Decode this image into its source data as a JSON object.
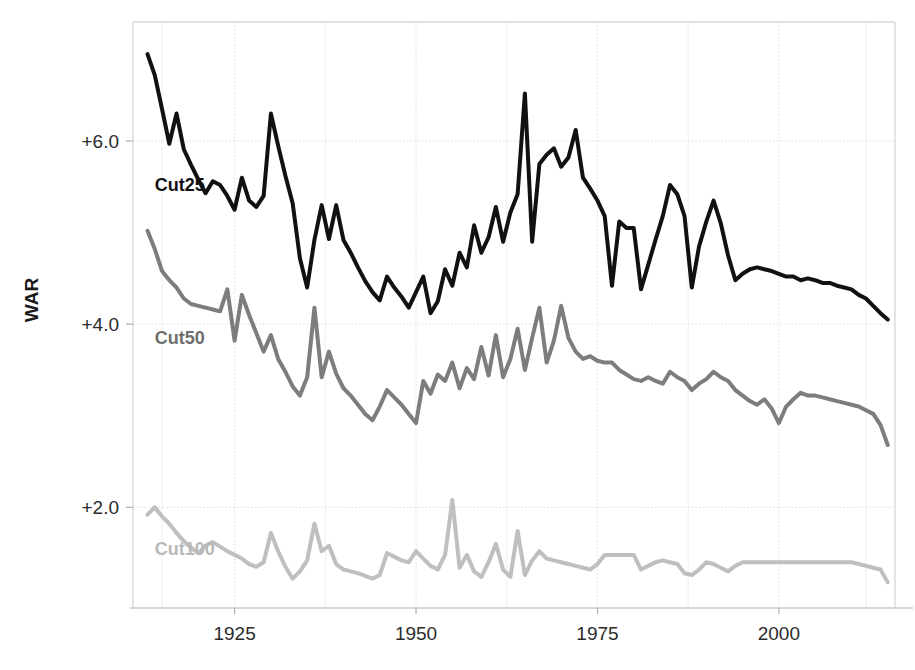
{
  "chart_data": {
    "type": "line",
    "title": "",
    "subtitle": "",
    "xlabel": "",
    "ylabel": "WAR",
    "xlim": [
      1911,
      2016
    ],
    "ylim": [
      0.9,
      7.3
    ],
    "grid": true,
    "legend_position": "inline-left",
    "x_tick_labels": [
      "1925",
      "1950",
      "1975",
      "2000"
    ],
    "x_ticks": [
      1925,
      1950,
      1975,
      2000
    ],
    "y_tick_labels": [
      "+2.0",
      "+4.0",
      "+6.0"
    ],
    "y_ticks": [
      2.0,
      4.0,
      6.0
    ],
    "annotations": [
      {
        "text": "Cut25",
        "x": 1914,
        "y": 5.45,
        "color": "#111111"
      },
      {
        "text": "Cut50",
        "x": 1914,
        "y": 3.78,
        "color": "#6e6e6e"
      },
      {
        "text": "Cut100",
        "x": 1914,
        "y": 1.48,
        "color": "#b8b8b8"
      }
    ],
    "x": [
      1913,
      1914,
      1915,
      1916,
      1917,
      1918,
      1919,
      1920,
      1921,
      1922,
      1923,
      1924,
      1925,
      1926,
      1927,
      1928,
      1929,
      1930,
      1931,
      1932,
      1933,
      1934,
      1935,
      1936,
      1937,
      1938,
      1939,
      1940,
      1941,
      1942,
      1943,
      1944,
      1945,
      1946,
      1947,
      1948,
      1949,
      1950,
      1951,
      1952,
      1953,
      1954,
      1955,
      1956,
      1957,
      1958,
      1959,
      1960,
      1961,
      1962,
      1963,
      1964,
      1965,
      1966,
      1967,
      1968,
      1969,
      1970,
      1971,
      1972,
      1973,
      1974,
      1975,
      1976,
      1977,
      1978,
      1979,
      1980,
      1981,
      1982,
      1983,
      1984,
      1985,
      1986,
      1987,
      1988,
      1989,
      1990,
      1991,
      1992,
      1993,
      1994,
      1995,
      1996,
      1997,
      1998,
      1999,
      2000,
      2001,
      2002,
      2003,
      2004,
      2005,
      2006,
      2007,
      2008,
      2009,
      2010,
      2011,
      2012,
      2013,
      2014,
      2015
    ],
    "series": [
      {
        "name": "Cut25",
        "color": "#111111",
        "linewidth": 4,
        "values": [
          6.95,
          6.72,
          6.35,
          5.97,
          6.3,
          5.91,
          5.74,
          5.58,
          5.43,
          5.56,
          5.52,
          5.4,
          5.25,
          5.6,
          5.35,
          5.28,
          5.4,
          6.3,
          5.95,
          5.62,
          5.32,
          4.72,
          4.4,
          4.92,
          5.3,
          4.93,
          5.3,
          4.92,
          4.78,
          4.62,
          4.47,
          4.35,
          4.26,
          4.52,
          4.4,
          4.3,
          4.18,
          4.35,
          4.52,
          4.12,
          4.25,
          4.6,
          4.42,
          4.78,
          4.62,
          5.08,
          4.78,
          4.95,
          5.28,
          4.9,
          5.22,
          5.42,
          6.52,
          4.9,
          5.75,
          5.85,
          5.92,
          5.72,
          5.82,
          6.12,
          5.6,
          5.48,
          5.35,
          5.18,
          4.42,
          5.12,
          5.05,
          5.05,
          4.38,
          4.65,
          4.92,
          5.18,
          5.52,
          5.42,
          5.18,
          4.4,
          4.85,
          5.12,
          5.35,
          5.1,
          4.75,
          4.48,
          4.55,
          4.6,
          4.62,
          4.6,
          4.58,
          4.55,
          4.52,
          4.52,
          4.48,
          4.5,
          4.48,
          4.45,
          4.45,
          4.42,
          4.4,
          4.38,
          4.32,
          4.28,
          4.2,
          4.12,
          4.05
        ]
      },
      {
        "name": "Cut50",
        "color": "#7d7d7d",
        "linewidth": 4,
        "values": [
          5.02,
          4.82,
          4.58,
          4.48,
          4.4,
          4.28,
          4.22,
          4.2,
          4.18,
          4.16,
          4.14,
          4.38,
          3.82,
          4.32,
          4.1,
          3.9,
          3.7,
          3.88,
          3.62,
          3.48,
          3.32,
          3.22,
          3.42,
          4.18,
          3.42,
          3.7,
          3.46,
          3.3,
          3.22,
          3.12,
          3.02,
          2.95,
          3.1,
          3.28,
          3.2,
          3.12,
          3.02,
          2.92,
          3.38,
          3.24,
          3.45,
          3.38,
          3.58,
          3.3,
          3.52,
          3.4,
          3.75,
          3.44,
          3.88,
          3.42,
          3.62,
          3.95,
          3.5,
          3.85,
          4.18,
          3.58,
          3.82,
          4.2,
          3.85,
          3.7,
          3.62,
          3.65,
          3.6,
          3.58,
          3.58,
          3.5,
          3.45,
          3.4,
          3.38,
          3.42,
          3.38,
          3.35,
          3.48,
          3.42,
          3.38,
          3.28,
          3.35,
          3.4,
          3.48,
          3.42,
          3.38,
          3.28,
          3.22,
          3.16,
          3.12,
          3.18,
          3.08,
          2.92,
          3.1,
          3.18,
          3.25,
          3.22,
          3.22,
          3.2,
          3.18,
          3.16,
          3.14,
          3.12,
          3.1,
          3.06,
          3.02,
          2.9,
          2.68
        ]
      },
      {
        "name": "Cut100",
        "color": "#bfbfbf",
        "linewidth": 4,
        "values": [
          1.92,
          2.0,
          1.9,
          1.82,
          1.72,
          1.63,
          1.56,
          1.5,
          1.58,
          1.62,
          1.57,
          1.52,
          1.48,
          1.44,
          1.38,
          1.35,
          1.4,
          1.72,
          1.52,
          1.35,
          1.22,
          1.3,
          1.42,
          1.82,
          1.52,
          1.58,
          1.38,
          1.32,
          1.3,
          1.28,
          1.25,
          1.22,
          1.26,
          1.5,
          1.46,
          1.42,
          1.4,
          1.52,
          1.44,
          1.36,
          1.32,
          1.48,
          2.08,
          1.34,
          1.48,
          1.3,
          1.24,
          1.4,
          1.6,
          1.32,
          1.24,
          1.74,
          1.26,
          1.42,
          1.52,
          1.44,
          1.42,
          1.4,
          1.38,
          1.36,
          1.34,
          1.32,
          1.38,
          1.48,
          1.48,
          1.48,
          1.48,
          1.48,
          1.32,
          1.36,
          1.4,
          1.42,
          1.4,
          1.38,
          1.28,
          1.26,
          1.32,
          1.4,
          1.38,
          1.34,
          1.3,
          1.36,
          1.4,
          1.4,
          1.4,
          1.4,
          1.4,
          1.4,
          1.4,
          1.4,
          1.4,
          1.4,
          1.4,
          1.4,
          1.4,
          1.4,
          1.4,
          1.4,
          1.38,
          1.36,
          1.34,
          1.32,
          1.18
        ]
      }
    ]
  },
  "axes": {
    "y_axis_title": "WAR"
  }
}
